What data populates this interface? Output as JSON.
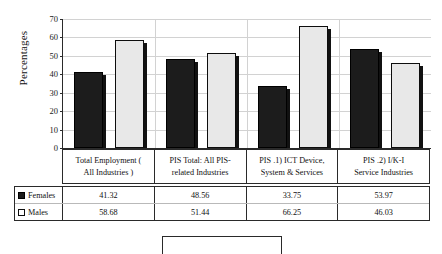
{
  "chart_data": {
    "type": "bar",
    "title": "",
    "xlabel": "",
    "ylabel": "Percentages",
    "ylim": [
      0,
      70
    ],
    "ytick_step": 10,
    "yticks": [
      "70",
      "60",
      "50",
      "40",
      "30",
      "20",
      "10",
      "0"
    ],
    "grid": true,
    "legend_position": "table-left",
    "categories": [
      "Total Employment ( All Industries )",
      "PIS Total: All PIS-related  Industries",
      "PIS  .1)  ICT Device, System & Services",
      "PIS  .2)  I/K-I Service  Industries"
    ],
    "category_lines": [
      [
        "Total Employment (",
        "All Industries )"
      ],
      [
        "PIS  Total:  All PIS-",
        "related  Industries"
      ],
      [
        "PIS    .1)   ICT Device,",
        "System & Services"
      ],
      [
        "PIS  .2)   I/K-I",
        "Service  Industries"
      ]
    ],
    "series": [
      {
        "name": "Females",
        "swatch": "filled-black-square",
        "color": "#1c1c1c",
        "values": [
          41.32,
          48.56,
          33.75,
          53.97
        ],
        "labels": [
          "41.32",
          "48.56",
          "33.75",
          "53.97"
        ]
      },
      {
        "name": "Males",
        "swatch": "hollow-white-square",
        "color": "#e8e8e8",
        "values": [
          58.68,
          51.44,
          66.25,
          46.03
        ],
        "labels": [
          "58.68",
          "51.44",
          "66.25",
          "46.03"
        ]
      }
    ]
  }
}
